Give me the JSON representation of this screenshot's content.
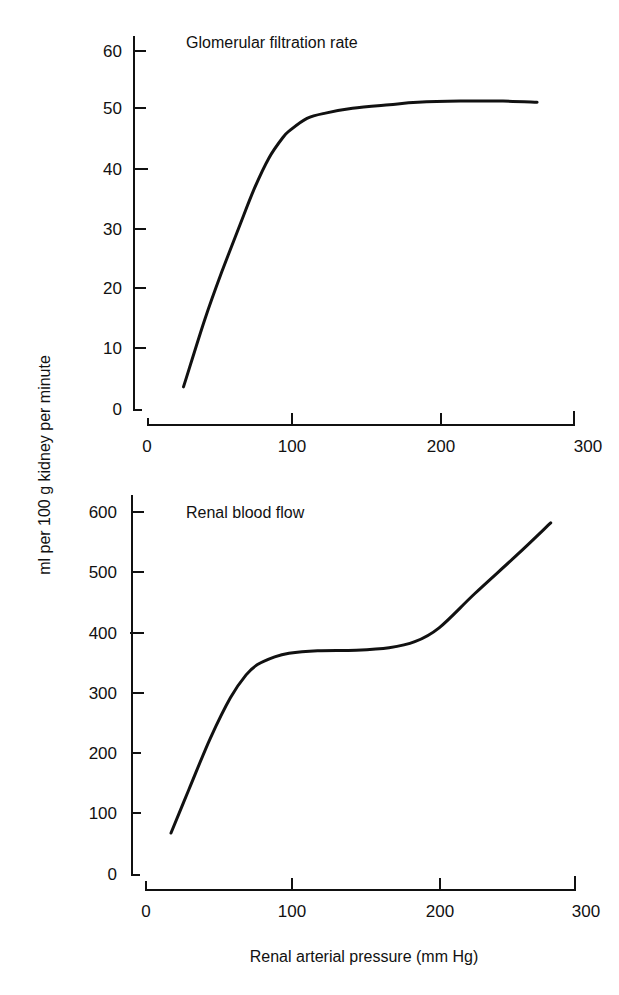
{
  "figure": {
    "ylabel": "ml per 100 g kidney per minute",
    "xlabel": "Renal arterial pressure (mm Hg)"
  },
  "chart_data": [
    {
      "type": "line",
      "title": "Glomerular filtration rate",
      "xlabel": "Renal arterial pressure (mm Hg)",
      "ylabel": "ml per 100 g kidney per minute",
      "xlim": [
        0,
        300
      ],
      "ylim": [
        0,
        60
      ],
      "xticks": [
        0,
        100,
        200,
        300
      ],
      "yticks": [
        0,
        10,
        20,
        30,
        40,
        50,
        60
      ],
      "grid": false,
      "series": [
        {
          "name": "Glomerular filtration rate",
          "x": [
            25,
            40,
            52,
            65,
            75,
            85,
            95,
            100,
            112,
            125,
            144,
            170,
            190,
            220,
            250,
            274
          ],
          "y": [
            3.7,
            15,
            23,
            31,
            37,
            42,
            45.5,
            46.7,
            48.7,
            49.6,
            50.4,
            51,
            51.4,
            51.6,
            51.6,
            51.4
          ]
        }
      ]
    },
    {
      "type": "line",
      "title": "Renal blood flow",
      "xlabel": "Renal arterial pressure (mm Hg)",
      "ylabel": "ml per 100 g kidney per minute",
      "xlim": [
        0,
        300
      ],
      "ylim": [
        0,
        600
      ],
      "xticks": [
        0,
        100,
        200,
        300
      ],
      "yticks": [
        0,
        100,
        200,
        300,
        400,
        500,
        600
      ],
      "grid": false,
      "series": [
        {
          "name": "Renal blood flow",
          "x": [
            17.5,
            30,
            45,
            59,
            70,
            78,
            90,
            100,
            120,
            147,
            170,
            188,
            205,
            230,
            260,
            283
          ],
          "y": [
            68,
            140,
            225,
            292,
            330,
            347,
            360,
            366,
            370,
            371,
            375,
            385,
            408,
            465,
            530,
            582
          ]
        }
      ]
    }
  ],
  "charts": {
    "top": {
      "title": "Glomerular filtration rate",
      "yticks": [
        "60",
        "50",
        "40",
        "30",
        "20",
        "10",
        "0"
      ],
      "xticks": [
        "0",
        "100",
        "200",
        "300"
      ]
    },
    "bottom": {
      "title": "Renal blood flow",
      "yticks": [
        "600",
        "500",
        "400",
        "300",
        "200",
        "100",
        "0"
      ],
      "xticks": [
        "0",
        "100",
        "200",
        "300"
      ]
    }
  }
}
